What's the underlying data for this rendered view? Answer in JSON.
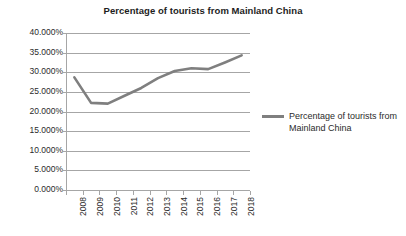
{
  "chart_data": {
    "type": "line",
    "title": "Percentage of tourists from Mainland China",
    "xlabel": "",
    "ylabel": "",
    "categories": [
      "2008",
      "2009",
      "2010",
      "2011",
      "2012",
      "2013",
      "2014",
      "2015",
      "2016",
      "2017",
      "2018"
    ],
    "series": [
      {
        "name": "Percentage of tourists from Mainland China",
        "color": "#7f7f7f",
        "values": [
          28.7,
          22.2,
          22.0,
          24.0,
          26.0,
          28.5,
          30.3,
          31.0,
          30.8,
          32.5,
          34.3
        ]
      }
    ],
    "ylim": [
      0,
      40
    ],
    "y_ticks": [
      0,
      5,
      10,
      15,
      20,
      25,
      30,
      35,
      40
    ],
    "y_tick_labels": [
      "0.000%",
      "5.000%",
      "10.000%",
      "15.000%",
      "20.000%",
      "25.000%",
      "30.000%",
      "35.000%",
      "40.000%"
    ],
    "grid": true,
    "grid_axis": "y",
    "legend_position": "right",
    "legend_entries": [
      "Percentage of tourists from Mainland China"
    ],
    "x_tick_rotation": -90,
    "value_format": "percent-3dp"
  },
  "colors": {
    "series": "#7f7f7f",
    "grid": "#a6a6a6",
    "axis": "#a6a6a6",
    "text": "#2b2b2b",
    "background": "#ffffff"
  }
}
